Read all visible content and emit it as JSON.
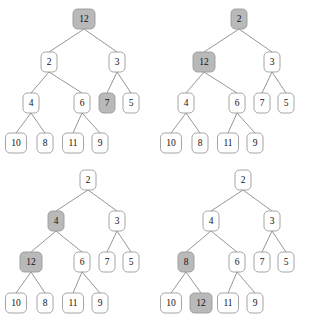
{
  "figure": {
    "background_color": "#ffffff",
    "node_fill_plain": "#ffffff",
    "node_fill_highlight": "#b9b9b9",
    "node_stroke": "#9a9a9a",
    "edge_stroke": "#8a8a8a",
    "panel_count": 4
  },
  "panels": [
    {
      "id": "panel-top-left",
      "origin_x": 0,
      "origin_y": 0,
      "nodes": [
        {
          "id": "tl-n0",
          "label": "12",
          "x": 84,
          "y": 19,
          "w": 22,
          "h": 20,
          "highlight": true
        },
        {
          "id": "tl-n1",
          "label": "2",
          "x": 49,
          "y": 62,
          "w": 16,
          "h": 20,
          "highlight": false
        },
        {
          "id": "tl-n2",
          "label": "3",
          "x": 117,
          "y": 62,
          "w": 16,
          "h": 20,
          "highlight": false
        },
        {
          "id": "tl-n3",
          "label": "4",
          "x": 31,
          "y": 103,
          "w": 16,
          "h": 20,
          "highlight": false
        },
        {
          "id": "tl-n4",
          "label": "6",
          "x": 82,
          "y": 103,
          "w": 16,
          "h": 20,
          "highlight": false
        },
        {
          "id": "tl-n5",
          "label": "7",
          "x": 107,
          "y": 103,
          "w": 16,
          "h": 20,
          "highlight": true
        },
        {
          "id": "tl-n6",
          "label": "5",
          "x": 131,
          "y": 103,
          "w": 16,
          "h": 20,
          "highlight": false
        },
        {
          "id": "tl-n7",
          "label": "10",
          "x": 16,
          "y": 143,
          "w": 21,
          "h": 20,
          "highlight": false
        },
        {
          "id": "tl-n8",
          "label": "8",
          "x": 45,
          "y": 143,
          "w": 16,
          "h": 20,
          "highlight": false
        },
        {
          "id": "tl-n9",
          "label": "11",
          "x": 73,
          "y": 143,
          "w": 21,
          "h": 20,
          "highlight": false
        },
        {
          "id": "tl-n10",
          "label": "9",
          "x": 100,
          "y": 143,
          "w": 16,
          "h": 20,
          "highlight": false
        }
      ],
      "edges": [
        [
          "tl-n0",
          "tl-n1"
        ],
        [
          "tl-n0",
          "tl-n2"
        ],
        [
          "tl-n1",
          "tl-n3"
        ],
        [
          "tl-n1",
          "tl-n4"
        ],
        [
          "tl-n2",
          "tl-n5"
        ],
        [
          "tl-n2",
          "tl-n6"
        ],
        [
          "tl-n3",
          "tl-n7"
        ],
        [
          "tl-n3",
          "tl-n8"
        ],
        [
          "tl-n4",
          "tl-n9"
        ],
        [
          "tl-n4",
          "tl-n10"
        ]
      ]
    },
    {
      "id": "panel-top-right",
      "origin_x": 155,
      "origin_y": 0,
      "nodes": [
        {
          "id": "tr-n0",
          "label": "2",
          "x": 239,
          "y": 19,
          "w": 16,
          "h": 20,
          "highlight": true
        },
        {
          "id": "tr-n1",
          "label": "12",
          "x": 204,
          "y": 62,
          "w": 22,
          "h": 20,
          "highlight": true
        },
        {
          "id": "tr-n2",
          "label": "3",
          "x": 272,
          "y": 62,
          "w": 16,
          "h": 20,
          "highlight": false
        },
        {
          "id": "tr-n3",
          "label": "4",
          "x": 186,
          "y": 103,
          "w": 16,
          "h": 20,
          "highlight": false
        },
        {
          "id": "tr-n4",
          "label": "6",
          "x": 237,
          "y": 103,
          "w": 16,
          "h": 20,
          "highlight": false
        },
        {
          "id": "tr-n5",
          "label": "7",
          "x": 262,
          "y": 103,
          "w": 16,
          "h": 20,
          "highlight": false
        },
        {
          "id": "tr-n6",
          "label": "5",
          "x": 286,
          "y": 103,
          "w": 16,
          "h": 20,
          "highlight": false
        },
        {
          "id": "tr-n7",
          "label": "10",
          "x": 171,
          "y": 143,
          "w": 21,
          "h": 20,
          "highlight": false
        },
        {
          "id": "tr-n8",
          "label": "8",
          "x": 200,
          "y": 143,
          "w": 16,
          "h": 20,
          "highlight": false
        },
        {
          "id": "tr-n9",
          "label": "11",
          "x": 228,
          "y": 143,
          "w": 21,
          "h": 20,
          "highlight": false
        },
        {
          "id": "tr-n10",
          "label": "9",
          "x": 255,
          "y": 143,
          "w": 16,
          "h": 20,
          "highlight": false
        }
      ],
      "edges": [
        [
          "tr-n0",
          "tr-n1"
        ],
        [
          "tr-n0",
          "tr-n2"
        ],
        [
          "tr-n1",
          "tr-n3"
        ],
        [
          "tr-n1",
          "tr-n4"
        ],
        [
          "tr-n2",
          "tr-n5"
        ],
        [
          "tr-n2",
          "tr-n6"
        ],
        [
          "tr-n3",
          "tr-n7"
        ],
        [
          "tr-n3",
          "tr-n8"
        ],
        [
          "tr-n4",
          "tr-n9"
        ],
        [
          "tr-n4",
          "tr-n10"
        ]
      ]
    },
    {
      "id": "panel-bottom-left",
      "origin_x": 0,
      "origin_y": 163,
      "nodes": [
        {
          "id": "bl-n0",
          "label": "2",
          "x": 88,
          "y": 180,
          "w": 16,
          "h": 20,
          "highlight": false
        },
        {
          "id": "bl-n1",
          "label": "4",
          "x": 56,
          "y": 221,
          "w": 16,
          "h": 20,
          "highlight": true
        },
        {
          "id": "bl-n2",
          "label": "3",
          "x": 117,
          "y": 221,
          "w": 16,
          "h": 20,
          "highlight": false
        },
        {
          "id": "bl-n3",
          "label": "12",
          "x": 31,
          "y": 262,
          "w": 22,
          "h": 20,
          "highlight": true
        },
        {
          "id": "bl-n4",
          "label": "6",
          "x": 82,
          "y": 262,
          "w": 16,
          "h": 20,
          "highlight": false
        },
        {
          "id": "bl-n5",
          "label": "7",
          "x": 107,
          "y": 262,
          "w": 16,
          "h": 20,
          "highlight": false
        },
        {
          "id": "bl-n6",
          "label": "5",
          "x": 131,
          "y": 262,
          "w": 16,
          "h": 20,
          "highlight": false
        },
        {
          "id": "bl-n7",
          "label": "10",
          "x": 16,
          "y": 303,
          "w": 21,
          "h": 20,
          "highlight": false
        },
        {
          "id": "bl-n8",
          "label": "8",
          "x": 45,
          "y": 303,
          "w": 16,
          "h": 20,
          "highlight": false
        },
        {
          "id": "bl-n9",
          "label": "11",
          "x": 73,
          "y": 303,
          "w": 21,
          "h": 20,
          "highlight": false
        },
        {
          "id": "bl-n10",
          "label": "9",
          "x": 100,
          "y": 303,
          "w": 16,
          "h": 20,
          "highlight": false
        }
      ],
      "edges": [
        [
          "bl-n0",
          "bl-n1"
        ],
        [
          "bl-n0",
          "bl-n2"
        ],
        [
          "bl-n1",
          "bl-n3"
        ],
        [
          "bl-n1",
          "bl-n4"
        ],
        [
          "bl-n2",
          "bl-n5"
        ],
        [
          "bl-n2",
          "bl-n6"
        ],
        [
          "bl-n3",
          "bl-n7"
        ],
        [
          "bl-n3",
          "bl-n8"
        ],
        [
          "bl-n4",
          "bl-n9"
        ],
        [
          "bl-n4",
          "bl-n10"
        ]
      ]
    },
    {
      "id": "panel-bottom-right",
      "origin_x": 155,
      "origin_y": 163,
      "nodes": [
        {
          "id": "br-n0",
          "label": "2",
          "x": 243,
          "y": 180,
          "w": 16,
          "h": 20,
          "highlight": false
        },
        {
          "id": "br-n1",
          "label": "4",
          "x": 211,
          "y": 221,
          "w": 16,
          "h": 20,
          "highlight": false
        },
        {
          "id": "br-n2",
          "label": "3",
          "x": 272,
          "y": 221,
          "w": 16,
          "h": 20,
          "highlight": false
        },
        {
          "id": "br-n3",
          "label": "8",
          "x": 186,
          "y": 262,
          "w": 16,
          "h": 20,
          "highlight": true
        },
        {
          "id": "br-n4",
          "label": "6",
          "x": 237,
          "y": 262,
          "w": 16,
          "h": 20,
          "highlight": false
        },
        {
          "id": "br-n5",
          "label": "7",
          "x": 262,
          "y": 262,
          "w": 16,
          "h": 20,
          "highlight": false
        },
        {
          "id": "br-n6",
          "label": "5",
          "x": 286,
          "y": 262,
          "w": 16,
          "h": 20,
          "highlight": false
        },
        {
          "id": "br-n7",
          "label": "10",
          "x": 171,
          "y": 303,
          "w": 21,
          "h": 20,
          "highlight": false
        },
        {
          "id": "br-n8",
          "label": "12",
          "x": 201,
          "y": 303,
          "w": 22,
          "h": 20,
          "highlight": true
        },
        {
          "id": "br-n9",
          "label": "11",
          "x": 228,
          "y": 303,
          "w": 21,
          "h": 20,
          "highlight": false
        },
        {
          "id": "br-n10",
          "label": "9",
          "x": 255,
          "y": 303,
          "w": 16,
          "h": 20,
          "highlight": false
        }
      ],
      "edges": [
        [
          "br-n0",
          "br-n1"
        ],
        [
          "br-n0",
          "br-n2"
        ],
        [
          "br-n1",
          "br-n3"
        ],
        [
          "br-n1",
          "br-n4"
        ],
        [
          "br-n2",
          "br-n5"
        ],
        [
          "br-n2",
          "br-n6"
        ],
        [
          "br-n3",
          "br-n7"
        ],
        [
          "br-n3",
          "br-n8"
        ],
        [
          "br-n4",
          "br-n9"
        ],
        [
          "br-n4",
          "br-n10"
        ]
      ]
    }
  ]
}
